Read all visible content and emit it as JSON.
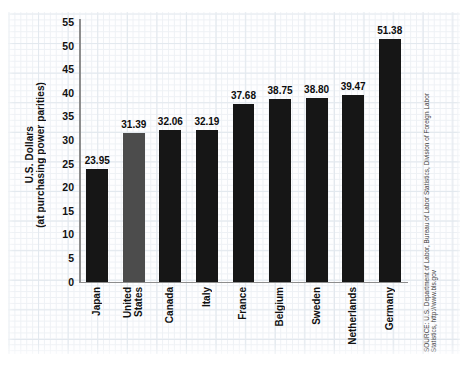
{
  "chart_data": {
    "type": "bar",
    "title": "",
    "subtitle": "",
    "xlabel": "",
    "ylabel": "U.S. Dollars (at purchasing power parities)",
    "ylabel_lines": [
      "U.S. Dollars",
      "(at purchasing power parities)"
    ],
    "categories": [
      "Japan",
      "United States",
      "Canada",
      "Italy",
      "France",
      "Belgium",
      "Sweden",
      "Netherlands",
      "Germany"
    ],
    "category_label_lines": [
      [
        "Japan"
      ],
      [
        "United",
        "States"
      ],
      [
        "Canada"
      ],
      [
        "Italy"
      ],
      [
        "France"
      ],
      [
        "Belgium"
      ],
      [
        "Sweden"
      ],
      [
        "Netherlands"
      ],
      [
        "Germany"
      ]
    ],
    "values": [
      23.95,
      31.39,
      32.06,
      32.19,
      37.68,
      38.75,
      38.8,
      39.47,
      51.38
    ],
    "value_labels": [
      "23.95",
      "31.39",
      "32.06",
      "32.19",
      "37.68",
      "38.75",
      "38.80",
      "39.47",
      "51.38"
    ],
    "highlight_index": 1,
    "bar_colors": [
      "#161616",
      "#4c4c4c",
      "#161616",
      "#161616",
      "#161616",
      "#161616",
      "#161616",
      "#161616",
      "#161616"
    ],
    "ylim": [
      0,
      55
    ],
    "ytick_labels": [
      "0",
      "5",
      "10",
      "15",
      "20",
      "25",
      "30",
      "35",
      "40",
      "45",
      "50",
      "55"
    ],
    "yticks": [
      0,
      5,
      10,
      15,
      20,
      25,
      30,
      35,
      40,
      45,
      50,
      55
    ],
    "grid": true,
    "grid_style": "graph-paper",
    "legend": "none",
    "legend_position": "none"
  },
  "source": {
    "lines": [
      "SOURCE: U.S. Department of Labor, Bureau of Labor Statistics, Division of Foreign Labor",
      "Statistics, http://www.bls.gov"
    ]
  },
  "colors": {
    "bar_default": "#161616",
    "bar_highlight": "#4c4c4c",
    "axis": "#8d8d8d",
    "grid_major": "#e2e8ee",
    "grid_minor": "#eef1f5",
    "text": "#111111",
    "source_text": "#3b3b3b",
    "background": "#ffffff"
  }
}
